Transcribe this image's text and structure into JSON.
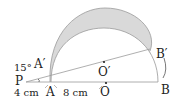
{
  "diagram": {
    "type": "geometry",
    "points": {
      "P": "P",
      "A": "A",
      "A_prime": "A′",
      "O": "O",
      "O_prime": "O′",
      "B": "B",
      "B_prime": "B′"
    },
    "labels": {
      "angle": "15°",
      "PA_length": "4 cm",
      "AO_length": "8 cm"
    },
    "colors": {
      "shade": "#d6d6d6",
      "line": "#9a9a9a",
      "text": "#222222"
    }
  }
}
